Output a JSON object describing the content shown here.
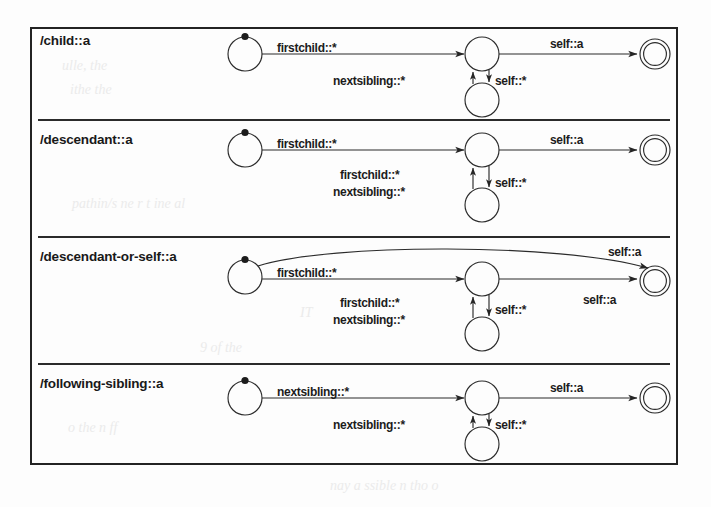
{
  "figure": {
    "caption_absent": true,
    "border_color": "#232323",
    "background_color": "#fdfdfd",
    "panels": [
      {
        "label": "/child::a",
        "states": {
          "start": {
            "kind": "start-state",
            "marker": "filled-dot-top"
          },
          "middle_top": {
            "kind": "state-circle"
          },
          "middle_bottom": {
            "kind": "state-circle"
          },
          "final": {
            "kind": "accepting-state-double-circle"
          }
        },
        "transitions": [
          {
            "from": "start",
            "to": "middle_top",
            "label": "firstchild::*",
            "style": "straight"
          },
          {
            "from": "middle_top",
            "to": "middle_bottom",
            "label": "self::*",
            "style": "straight-down"
          },
          {
            "from": "middle_bottom",
            "to": "middle_top",
            "label": "nextsibling::*",
            "style": "straight-up"
          },
          {
            "from": "middle_top",
            "to": "final",
            "label": "self::a",
            "style": "straight"
          }
        ]
      },
      {
        "label": "/descendant::a",
        "states": {
          "start": {
            "kind": "start-state",
            "marker": "filled-dot-top"
          },
          "middle_top": {
            "kind": "state-circle"
          },
          "middle_bottom": {
            "kind": "state-circle"
          },
          "final": {
            "kind": "accepting-state-double-circle"
          }
        },
        "transitions": [
          {
            "from": "start",
            "to": "middle_top",
            "label": "firstchild::*",
            "style": "straight"
          },
          {
            "from": "middle_top",
            "to": "middle_bottom",
            "label": "self::*",
            "style": "straight-down"
          },
          {
            "from": "middle_bottom",
            "to": "middle_top",
            "label": "firstchild::*\nnextsibling::*",
            "label_line1": "firstchild::*",
            "label_line2": "nextsibling::*",
            "style": "straight-up"
          },
          {
            "from": "middle_top",
            "to": "final",
            "label": "self::a",
            "style": "straight"
          }
        ]
      },
      {
        "label": "/descendant-or-self::a",
        "states": {
          "start": {
            "kind": "start-state",
            "marker": "filled-dot-top"
          },
          "middle_top": {
            "kind": "state-circle"
          },
          "middle_bottom": {
            "kind": "state-circle"
          },
          "final": {
            "kind": "accepting-state-double-circle"
          }
        },
        "transitions": [
          {
            "from": "start",
            "to": "final",
            "label": "self::a",
            "style": "curved-arc-over"
          },
          {
            "from": "start",
            "to": "middle_top",
            "label": "firstchild::*",
            "style": "straight"
          },
          {
            "from": "middle_top",
            "to": "middle_bottom",
            "label": "self::*",
            "style": "straight-down"
          },
          {
            "from": "middle_bottom",
            "to": "middle_top",
            "label_line1": "firstchild::*",
            "label_line2": "nextsibling::*",
            "style": "straight-up"
          },
          {
            "from": "middle_top",
            "to": "final",
            "label": "self::a",
            "style": "straight"
          }
        ]
      },
      {
        "label": "/following-sibling::a",
        "states": {
          "start": {
            "kind": "start-state",
            "marker": "filled-dot-top"
          },
          "middle_top": {
            "kind": "state-circle"
          },
          "middle_bottom": {
            "kind": "state-circle"
          },
          "final": {
            "kind": "accepting-state-double-circle"
          }
        },
        "transitions": [
          {
            "from": "start",
            "to": "middle_top",
            "label": "nextsibling::*",
            "style": "straight"
          },
          {
            "from": "middle_top",
            "to": "middle_bottom",
            "label": "self::*",
            "style": "straight-down"
          },
          {
            "from": "middle_bottom",
            "to": "middle_top",
            "label": "nextsibling::*",
            "style": "straight-up"
          },
          {
            "from": "middle_top",
            "to": "final",
            "label": "self::a",
            "style": "straight"
          }
        ]
      }
    ]
  },
  "labels": {
    "p1_title": "/child::a",
    "p1_e1": "firstchild::*",
    "p1_e2": "nextsibling::*",
    "p1_e3": "self::*",
    "p1_e4": "self::a",
    "p2_title": "/descendant::a",
    "p2_e1": "firstchild::*",
    "p2_e2a": "firstchild::*",
    "p2_e2b": "nextsibling::*",
    "p2_e3": "self::*",
    "p2_e4": "self::a",
    "p3_title": "/descendant-or-self::a",
    "p3_e0": "self::a",
    "p3_e1": "firstchild::*",
    "p3_e2a": "firstchild::*",
    "p3_e2b": "nextsibling::*",
    "p3_e3": "self::*",
    "p3_e4": "self::a",
    "p4_title": "/following-sibling::a",
    "p4_e1": "nextsibling::*",
    "p4_e2": "nextsibling::*",
    "p4_e3": "self::*",
    "p4_e4": "self::a"
  },
  "bleed_through": [
    "ulle, the",
    "ithe  the",
    "pathin/s  ne  r  t  ine  al",
    "IT",
    "o  the  n  ff",
    "9 of  the",
    "nay  a  ssible  n  tho  o"
  ]
}
